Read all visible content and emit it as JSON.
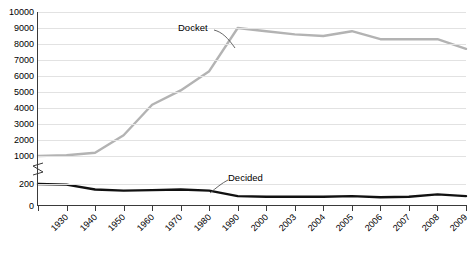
{
  "chart_data": {
    "type": "line",
    "title": "",
    "xlabel": "",
    "ylabel": "",
    "grid": true,
    "legend_position": "inline-annotations",
    "broken_axis": true,
    "y_break_between": [
      200,
      1000
    ],
    "y_ticks_upper": [
      1000,
      2000,
      3000,
      4000,
      5000,
      6000,
      7000,
      8000,
      9000,
      10000
    ],
    "y_ticks_lower": [
      0,
      200
    ],
    "x": [
      "1930",
      "1940",
      "1950",
      "1960",
      "1970",
      "1980",
      "1990",
      "2000",
      "2003",
      "2004",
      "2005",
      "2006",
      "2007",
      "2008",
      "2009",
      "2010"
    ],
    "series": [
      {
        "name": "Docket",
        "color": "#b3b3b3",
        "values": [
          1000,
          1050,
          1200,
          2300,
          4200,
          5100,
          6300,
          9000,
          8800,
          8600,
          8500,
          8800,
          8300,
          8300,
          8300,
          7700
        ]
      },
      {
        "name": "Decided",
        "color": "#111111",
        "values": [
          200,
          195,
          150,
          140,
          145,
          150,
          140,
          90,
          85,
          85,
          85,
          90,
          80,
          85,
          105,
          90
        ]
      }
    ]
  },
  "axis": {
    "y_labels": [
      "10000",
      "9000",
      "8000",
      "7000",
      "6000",
      "5000",
      "4000",
      "3000",
      "2000",
      "1000",
      "200",
      "0"
    ],
    "x_labels": [
      "1930",
      "1940",
      "1950",
      "1960",
      "1970",
      "1980",
      "1990",
      "2000",
      "2003",
      "2004",
      "2005",
      "2006",
      "2007",
      "2008",
      "2009",
      "2010"
    ]
  },
  "annotations": {
    "docket": "Docket",
    "decided": "Decided"
  }
}
